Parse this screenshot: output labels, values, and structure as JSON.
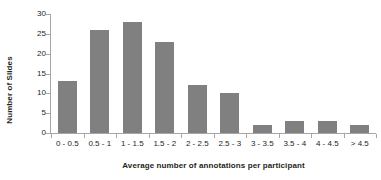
{
  "chart_data": {
    "type": "bar",
    "title": "",
    "xlabel": "Average number of annotations per participant",
    "ylabel": "Number of Slides",
    "categories": [
      "0 - 0.5",
      "0.5 - 1",
      "1 - 1.5",
      "1.5 - 2",
      "2 - 2.5",
      "2.5 - 3",
      "3 - 3.5",
      "3.5 - 4",
      "4 - 4.5",
      "> 4.5"
    ],
    "values": [
      13,
      26,
      28,
      23,
      12,
      10,
      2,
      3,
      3,
      2
    ],
    "ylim": [
      0,
      30
    ],
    "yticks": [
      0,
      5,
      10,
      15,
      20,
      25,
      30
    ],
    "ytick_labels": [
      "0",
      "5",
      "10",
      "15",
      "20",
      "25",
      "30"
    ],
    "grid": false,
    "legend": false,
    "bar_color": "#808080",
    "axis_color": "#a6a6a6",
    "text_color": "#231f20"
  }
}
